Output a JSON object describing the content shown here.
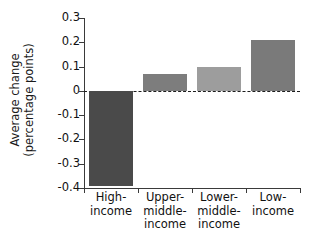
{
  "chart_data": {
    "type": "bar",
    "title": "",
    "xlabel": "",
    "ylabel": "Average change (percentage points)",
    "ylabel_line1": "Average change",
    "ylabel_line2": "(percentage points)",
    "categories": [
      "High-income",
      "Upper-middle-income",
      "Lower-middle-income",
      "Low-income"
    ],
    "category_lines": [
      [
        "High-",
        "income"
      ],
      [
        "Upper-",
        "middle-",
        "income"
      ],
      [
        "Lower-",
        "middle-",
        "income"
      ],
      [
        "Low-",
        "income"
      ]
    ],
    "values": [
      -0.39,
      0.07,
      0.1,
      0.21
    ],
    "bar_colors": [
      "#4a4a4a",
      "#7d7d7d",
      "#9d9d9d",
      "#7a7a7a"
    ],
    "ylim": [
      -0.4,
      0.3
    ],
    "yticks": [
      0.3,
      0.2,
      0.1,
      0,
      -0.1,
      -0.2,
      -0.3,
      -0.4
    ],
    "ytick_labels": [
      "0.3",
      "0.2",
      "0.1",
      "0",
      "-0.1",
      "-0.2",
      "-0.3",
      "-0.4"
    ],
    "grid": false,
    "legend": "none",
    "zero_reference_line": true,
    "zero_reference_style": "dashed"
  }
}
